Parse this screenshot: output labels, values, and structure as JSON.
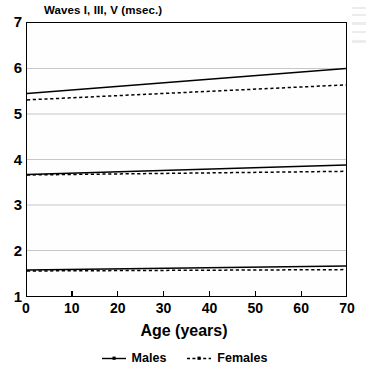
{
  "chart_data": {
    "type": "line",
    "title": "Waves I, III, V (msec.)",
    "xlabel": "Age (years)",
    "ylabel": "",
    "xlim": [
      0,
      70
    ],
    "ylim": [
      1,
      7
    ],
    "xticks": [
      0,
      10,
      20,
      30,
      40,
      50,
      60,
      70
    ],
    "yticks": [
      1,
      2,
      3,
      4,
      5,
      6,
      7
    ],
    "grid": "horizontal",
    "legend_position": "bottom-center",
    "x": [
      0,
      70
    ],
    "series": [
      {
        "name": "Males",
        "wave": "V",
        "style": "solid",
        "values": [
          5.45,
          6.0
        ]
      },
      {
        "name": "Females",
        "wave": "V",
        "style": "dashed",
        "values": [
          5.31,
          5.64
        ]
      },
      {
        "name": "Males",
        "wave": "III",
        "style": "solid",
        "values": [
          3.67,
          3.88
        ]
      },
      {
        "name": "Females",
        "wave": "III",
        "style": "dashed",
        "values": [
          3.66,
          3.74
        ]
      },
      {
        "name": "Males",
        "wave": "I",
        "style": "solid",
        "values": [
          1.57,
          1.66
        ]
      },
      {
        "name": "Females",
        "wave": "I",
        "style": "dashed",
        "values": [
          1.55,
          1.58
        ]
      }
    ]
  },
  "legend": {
    "items": [
      {
        "label": "Males",
        "style": "solid"
      },
      {
        "label": "Females",
        "style": "dashed"
      }
    ]
  }
}
